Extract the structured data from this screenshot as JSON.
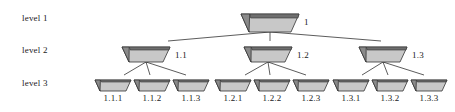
{
  "diagram": {
    "background_color": "#ffffff",
    "node_body_color": "#c8c8c8",
    "node_top_bar_color": "#6e6e6e",
    "node_wedge_color": "#8a8a8a",
    "outline_color": "#333333",
    "edge_color": "#4a4a4a",
    "text_color": "#1a1a1a"
  },
  "level_labels": [
    {
      "id": "level-1",
      "text": "level 1",
      "x": 22,
      "y": 13
    },
    {
      "id": "level-2",
      "text": "level 2",
      "x": 22,
      "y": 45
    },
    {
      "id": "level-3",
      "text": "level 3",
      "x": 22,
      "y": 78
    }
  ],
  "levels": [
    {
      "name": "level 1",
      "nodes": [
        {
          "id": "node-1",
          "label": "1",
          "cx": 270,
          "cy": 14,
          "half_top": 29,
          "half_bottom": 21,
          "height": 18,
          "label_x": 304,
          "label_y": 17
        }
      ]
    },
    {
      "name": "level 2",
      "nodes": [
        {
          "id": "node-1-1",
          "label": "1.1",
          "cx": 146,
          "cy": 47,
          "half_top": 24,
          "half_bottom": 17,
          "height": 15,
          "label_x": 175,
          "label_y": 50
        },
        {
          "id": "node-1-2",
          "label": "1.2",
          "cx": 268,
          "cy": 47,
          "half_top": 24,
          "half_bottom": 17,
          "height": 15,
          "label_x": 297,
          "label_y": 50
        },
        {
          "id": "node-1-3",
          "label": "1.3",
          "cx": 383,
          "cy": 47,
          "half_top": 24,
          "half_bottom": 17,
          "height": 15,
          "label_x": 412,
          "label_y": 50
        }
      ]
    },
    {
      "name": "level 3",
      "nodes": [
        {
          "id": "node-1-1-1",
          "label": "1.1.1",
          "cx": 113,
          "cy": 80,
          "half_top": 18,
          "half_bottom": 13,
          "height": 11,
          "label_x": 113,
          "label_y": 93
        },
        {
          "id": "node-1-1-2",
          "label": "1.1.2",
          "cx": 152,
          "cy": 80,
          "half_top": 18,
          "half_bottom": 13,
          "height": 11,
          "label_x": 152,
          "label_y": 93
        },
        {
          "id": "node-1-1-3",
          "label": "1.1.3",
          "cx": 191,
          "cy": 80,
          "half_top": 18,
          "half_bottom": 13,
          "height": 11,
          "label_x": 191,
          "label_y": 93
        },
        {
          "id": "node-1-2-1",
          "label": "1.2.1",
          "cx": 233,
          "cy": 80,
          "half_top": 18,
          "half_bottom": 13,
          "height": 11,
          "label_x": 233,
          "label_y": 93
        },
        {
          "id": "node-1-2-2",
          "label": "1.2.2",
          "cx": 272,
          "cy": 80,
          "half_top": 18,
          "half_bottom": 13,
          "height": 11,
          "label_x": 272,
          "label_y": 93
        },
        {
          "id": "node-1-2-3",
          "label": "1.2.3",
          "cx": 311,
          "cy": 80,
          "half_top": 18,
          "half_bottom": 13,
          "height": 11,
          "label_x": 311,
          "label_y": 93
        },
        {
          "id": "node-1-3-1",
          "label": "1.3.1",
          "cx": 351,
          "cy": 80,
          "half_top": 18,
          "half_bottom": 13,
          "height": 11,
          "label_x": 351,
          "label_y": 93
        },
        {
          "id": "node-1-3-2",
          "label": "1.3.2",
          "cx": 390,
          "cy": 80,
          "half_top": 18,
          "half_bottom": 13,
          "height": 11,
          "label_x": 390,
          "label_y": 93
        },
        {
          "id": "node-1-3-3",
          "label": "1.3.3",
          "cx": 429,
          "cy": 80,
          "half_top": 18,
          "half_bottom": 13,
          "height": 11,
          "label_x": 429,
          "label_y": 93
        }
      ]
    }
  ],
  "edges": [
    {
      "id": "edge-1-to-1-1",
      "from": "node-1",
      "to": "node-1-1",
      "x1": 270,
      "y1": 32,
      "x2": 168,
      "y2": 41
    },
    {
      "id": "edge-1-to-1-2",
      "from": "node-1",
      "to": "node-1-2",
      "x1": 270,
      "y1": 32,
      "x2": 270,
      "y2": 41
    },
    {
      "id": "edge-1-to-1-3",
      "from": "node-1",
      "to": "node-1-3",
      "x1": 270,
      "y1": 32,
      "x2": 381,
      "y2": 41
    },
    {
      "id": "edge-1-1-to-1-1-1",
      "from": "node-1-1",
      "to": "node-1-1-1",
      "x1": 146,
      "y1": 62,
      "x2": 124,
      "y2": 75
    },
    {
      "id": "edge-1-1-to-1-1-2",
      "from": "node-1-1",
      "to": "node-1-1-2",
      "x1": 146,
      "y1": 62,
      "x2": 150,
      "y2": 75
    },
    {
      "id": "edge-1-1-to-1-1-3",
      "from": "node-1-1",
      "to": "node-1-1-3",
      "x1": 146,
      "y1": 62,
      "x2": 186,
      "y2": 75
    },
    {
      "id": "edge-1-2-to-1-2-1",
      "from": "node-1-2",
      "to": "node-1-2-1",
      "x1": 268,
      "y1": 62,
      "x2": 245,
      "y2": 75
    },
    {
      "id": "edge-1-2-to-1-2-2",
      "from": "node-1-2",
      "to": "node-1-2-2",
      "x1": 268,
      "y1": 62,
      "x2": 270,
      "y2": 75
    },
    {
      "id": "edge-1-2-to-1-2-3",
      "from": "node-1-2",
      "to": "node-1-2-3",
      "x1": 268,
      "y1": 62,
      "x2": 306,
      "y2": 75
    },
    {
      "id": "edge-1-3-to-1-3-1",
      "from": "node-1-3",
      "to": "node-1-3-1",
      "x1": 383,
      "y1": 62,
      "x2": 362,
      "y2": 75
    },
    {
      "id": "edge-1-3-to-1-3-2",
      "from": "node-1-3",
      "to": "node-1-3-2",
      "x1": 383,
      "y1": 62,
      "x2": 388,
      "y2": 75
    },
    {
      "id": "edge-1-3-to-1-3-3",
      "from": "node-1-3",
      "to": "node-1-3-3",
      "x1": 383,
      "y1": 62,
      "x2": 424,
      "y2": 75
    }
  ]
}
